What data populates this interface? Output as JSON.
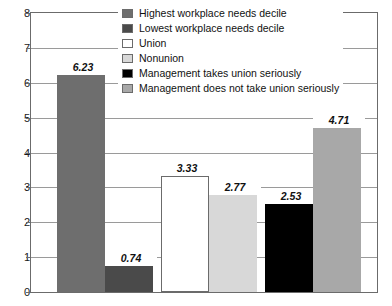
{
  "chart_data": {
    "type": "bar",
    "title": "",
    "xlabel": "",
    "ylabel": "",
    "ylim": [
      0,
      8
    ],
    "y_ticks": [
      "0",
      "1",
      "2",
      "3",
      "4",
      "5",
      "6",
      "7",
      "8"
    ],
    "grid": true,
    "legend_position": "top-right-inside",
    "categories": [
      "Highest workplace needs decile",
      "Lowest workplace needs decile",
      "Union",
      "Nonunion",
      "Management takes union seriously",
      "Management does not take union seriously"
    ],
    "values": [
      6.23,
      0.74,
      3.33,
      2.77,
      2.53,
      4.71
    ],
    "value_labels": [
      "6.23",
      "0.74",
      "3.33",
      "2.77",
      "2.53",
      "4.71"
    ],
    "colors": [
      "#6e6e6e",
      "#4a4a4a",
      "#ffffff",
      "#d8d8d8",
      "#000000",
      "#a8a8a8"
    ],
    "bars": [
      {
        "label": "Highest workplace needs decile",
        "value": 6.23,
        "value_label": "6.23",
        "color": "#6e6e6e",
        "x": 26,
        "width": 48
      },
      {
        "label": "Lowest workplace needs decile",
        "value": 0.74,
        "value_label": "0.74",
        "color": "#4a4a4a",
        "x": 74,
        "width": 48
      },
      {
        "label": "Union",
        "value": 3.33,
        "value_label": "3.33",
        "color": "#ffffff",
        "x": 130,
        "width": 48
      },
      {
        "label": "Nonunion",
        "value": 2.77,
        "value_label": "2.77",
        "color": "#d8d8d8",
        "x": 178,
        "width": 48
      },
      {
        "label": "Management takes union seriously",
        "value": 2.53,
        "value_label": "2.53",
        "color": "#000000",
        "x": 234,
        "width": 48
      },
      {
        "label": "Management does not take union seriously",
        "value": 4.71,
        "value_label": "4.71",
        "color": "#a8a8a8",
        "x": 282,
        "width": 48
      }
    ]
  },
  "legend": {
    "items": [
      {
        "label": "Highest workplace needs decile",
        "color": "#6e6e6e"
      },
      {
        "label": "Lowest workplace needs decile",
        "color": "#4a4a4a"
      },
      {
        "label": "Union",
        "color": "#ffffff"
      },
      {
        "label": "Nonunion",
        "color": "#d8d8d8"
      },
      {
        "label": "Management takes union seriously",
        "color": "#000000"
      },
      {
        "label": "Management does not take union seriously",
        "color": "#a8a8a8"
      }
    ]
  },
  "axis": {
    "y_max": 8,
    "y_min": 0
  }
}
